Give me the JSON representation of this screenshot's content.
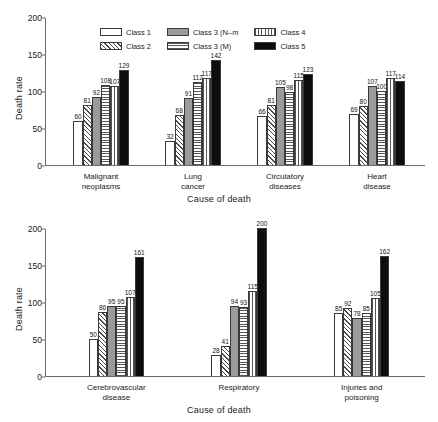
{
  "chart_data": [
    {
      "type": "bar",
      "panel": "top",
      "title": "",
      "xlabel": "Cause of death",
      "ylabel": "Death rate",
      "ylim": [
        0,
        200
      ],
      "yticks": [
        0,
        50,
        100,
        150,
        200
      ],
      "grid": false,
      "legend_position": "top-center",
      "categories": [
        "Malignant neoplasms",
        "Lung cancer",
        "Circulatory diseases",
        "Heart disease"
      ],
      "series": [
        {
          "name": "Class 1",
          "pattern": "empty",
          "values": [
            60,
            32,
            66,
            69
          ]
        },
        {
          "name": "Class 2",
          "pattern": "diagonal-hatch",
          "values": [
            81,
            68,
            81,
            80
          ]
        },
        {
          "name": "Class 3 (N–m",
          "pattern": "solid-gray",
          "values": [
            92,
            91,
            105,
            107
          ]
        },
        {
          "name": "Class 3 (M)",
          "pattern": "horizontal-lines",
          "values": [
            108,
            112,
            98,
            100
          ]
        },
        {
          "name": "Class 4",
          "pattern": "vertical-lines",
          "values": [
            107,
            117,
            115,
            117
          ]
        },
        {
          "name": "Class 5",
          "pattern": "solid-black",
          "values": [
            129,
            142,
            123,
            114
          ]
        }
      ]
    },
    {
      "type": "bar",
      "panel": "bottom",
      "title": "",
      "xlabel": "Cause of death",
      "ylabel": "Death rate",
      "ylim": [
        0,
        200
      ],
      "yticks": [
        0,
        50,
        100,
        150,
        200
      ],
      "grid": false,
      "legend_position": "none",
      "categories": [
        "Cerebrovascular disease",
        "Respiratory",
        "Injuries and poisoning"
      ],
      "series": [
        {
          "name": "Class 1",
          "pattern": "empty",
          "values": [
            50,
            28,
            85
          ]
        },
        {
          "name": "Class 2",
          "pattern": "diagonal-hatch",
          "values": [
            86,
            41,
            92
          ]
        },
        {
          "name": "Class 3 (N–m",
          "pattern": "solid-gray",
          "values": [
            95,
            94,
            78
          ]
        },
        {
          "name": "Class 3 (M)",
          "pattern": "horizontal-lines",
          "values": [
            95,
            93,
            85
          ]
        },
        {
          "name": "Class 4",
          "pattern": "vertical-lines",
          "values": [
            107,
            115,
            105
          ]
        },
        {
          "name": "Class 5",
          "pattern": "solid-black",
          "values": [
            161,
            200,
            162
          ]
        }
      ]
    }
  ],
  "legend": {
    "items": [
      {
        "label": "Class 1",
        "pattern": "empty"
      },
      {
        "label": "Class 3 (N–m",
        "pattern": "solid-gray"
      },
      {
        "label": "Class 4",
        "pattern": "vertical-lines"
      },
      {
        "label": "Class 2",
        "pattern": "diagonal-hatch"
      },
      {
        "label": "Class 3 (M)",
        "pattern": "horizontal-lines"
      },
      {
        "label": "Class 5",
        "pattern": "solid-black"
      }
    ]
  },
  "axis": {
    "ylabel": "Death rate",
    "xlabel": "Cause of death",
    "yticks": [
      "0",
      "50",
      "100",
      "150",
      "200"
    ]
  },
  "categories_top": [
    [
      "Malignant",
      "neoplasms"
    ],
    [
      "Lung",
      "cancer"
    ],
    [
      "Circulatory",
      "diseases"
    ],
    [
      "Heart",
      "disease"
    ]
  ],
  "categories_bottom": [
    [
      "Cerebrovascular",
      "disease"
    ],
    [
      "Respiratory",
      ""
    ],
    [
      "Injuries and",
      "poisoning"
    ]
  ],
  "colors": {
    "axis": "#6b6b6b",
    "bar_outline": "#3a3a3a",
    "class3nm_fill": "#9a9a9a",
    "class5_fill": "#0d0d0d",
    "text": "#1a1a1a"
  }
}
